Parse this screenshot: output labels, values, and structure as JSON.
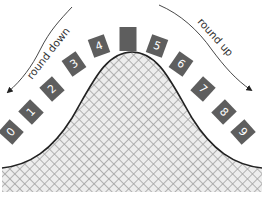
{
  "diagram": {
    "title": "",
    "labels": {
      "left": "round down",
      "right": "round up"
    },
    "tiles": [
      {
        "label": "0"
      },
      {
        "label": "1"
      },
      {
        "label": "2"
      },
      {
        "label": "3"
      },
      {
        "label": "4"
      },
      {
        "label": ""
      },
      {
        "label": "5"
      },
      {
        "label": "6"
      },
      {
        "label": "7"
      },
      {
        "label": "8"
      },
      {
        "label": "9"
      }
    ],
    "colors": {
      "tile": "#5e5e5e",
      "tile_text": "#ffffff",
      "curve": "#222222",
      "hatch_line": "#9a9a9a",
      "hatch_bg": "#e8e8e8"
    }
  }
}
